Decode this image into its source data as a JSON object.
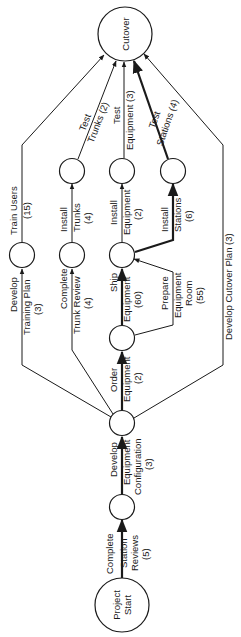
{
  "diagram": {
    "type": "pert-network",
    "orientation": "rotated-90-ccw",
    "colors": {
      "line": "#1a1a1a",
      "background": "#ffffff"
    },
    "nodes": {
      "start": {
        "label_lines": [
          "Project",
          "Start"
        ]
      },
      "cutover": {
        "label_lines": [
          "Cutover"
        ]
      }
    },
    "activities": {
      "station_reviews": {
        "lines": [
          "Complete",
          "Station",
          "Reviews",
          "(5)"
        ],
        "duration": 5,
        "critical": true
      },
      "equipment_config": {
        "lines": [
          "Develop",
          "Equipment",
          "Configuration",
          "(3)"
        ],
        "duration": 3,
        "critical": true
      },
      "training_plan": {
        "lines": [
          "Develop",
          "Training Plan",
          "(3)"
        ],
        "duration": 3,
        "critical": false
      },
      "trunk_review": {
        "lines": [
          "Complete",
          "Trunk Review",
          "(4)"
        ],
        "duration": 4,
        "critical": false
      },
      "order_equipment": {
        "lines": [
          "Order",
          "Equipment",
          "(2)"
        ],
        "duration": 2,
        "critical": true
      },
      "cutover_plan": {
        "lines": [
          "Develop Cutover Plan (3)"
        ],
        "duration": 3,
        "critical": false
      },
      "ship_equipment": {
        "lines": [
          "Ship",
          "Equipment",
          "(60)"
        ],
        "duration": 60,
        "critical": true
      },
      "prepare_room": {
        "lines": [
          "Prepare",
          "Equipment",
          "Room",
          "(55)"
        ],
        "duration": 55,
        "critical": false
      },
      "train_users": {
        "lines": [
          "Train Users",
          "(15)"
        ],
        "duration": 15,
        "critical": false
      },
      "install_trunks": {
        "lines": [
          "Install",
          "Trunks",
          "(4)"
        ],
        "duration": 4,
        "critical": false
      },
      "install_equipment": {
        "lines": [
          "Install",
          "Equipment",
          "(2)"
        ],
        "duration": 2,
        "critical": false
      },
      "install_stations": {
        "lines": [
          "Install",
          "Stations",
          "(6)"
        ],
        "duration": 6,
        "critical": true
      },
      "test_trunks": {
        "lines": [
          "Test",
          "Trunks (2)"
        ],
        "duration": 2,
        "critical": false
      },
      "test_equipment": {
        "lines": [
          "Test",
          "Equipment (3)"
        ],
        "duration": 3,
        "critical": false
      },
      "test_stations": {
        "lines": [
          "Test",
          "Stations (4)"
        ],
        "duration": 4,
        "critical": true
      }
    }
  }
}
